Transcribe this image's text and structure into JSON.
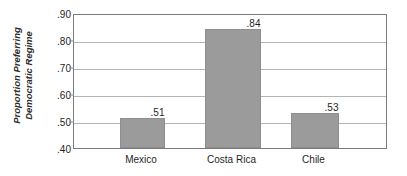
{
  "chart_data": {
    "type": "bar",
    "title": "",
    "xlabel": "",
    "ylabel": "Proportion Preferring Democratic Regime",
    "ylabel_line1": "Proportion Preferring",
    "ylabel_line2": "Democratic Regime",
    "categories": [
      "Mexico",
      "Costa Rica",
      "Chile"
    ],
    "values": [
      0.51,
      0.84,
      0.53
    ],
    "value_labels": [
      ".51",
      ".84",
      ".53"
    ],
    "ylim": [
      0.4,
      0.9
    ],
    "yticks": [
      0.9,
      0.8,
      0.7,
      0.6,
      0.5,
      0.4
    ],
    "ytick_labels": [
      ".90",
      ".80",
      ".70",
      ".60",
      ".50",
      ".40"
    ],
    "grid": true,
    "legend": "none",
    "bar_color": "#9b9b9b",
    "grid_color": "#b4b4b4",
    "frame_color": "#7a7a7a",
    "background": "#ffffff"
  }
}
